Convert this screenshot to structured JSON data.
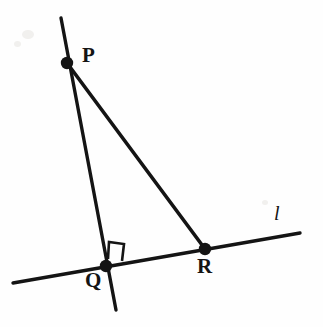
{
  "figure": {
    "kind": "geometry-diagram",
    "background_color": "#fefefe",
    "stroke_color": "#141414",
    "width": 323,
    "height": 327
  },
  "points": [
    {
      "id": "P",
      "label": "P",
      "x": 67,
      "y": 63,
      "marker": "filled-dot",
      "radius": 6.2
    },
    {
      "id": "Q",
      "label": "Q",
      "x": 106,
      "y": 266,
      "marker": "filled-dot",
      "radius": 6.2
    },
    {
      "id": "R",
      "label": "R",
      "x": 205,
      "y": 249,
      "marker": "filled-dot",
      "radius": 6.2
    }
  ],
  "lines": [
    {
      "id": "line-l",
      "label": "l",
      "label_style": "italic",
      "x1": 13,
      "y1": 283,
      "x2": 300,
      "y2": 233,
      "stroke_width": 3.4,
      "through": [
        "Q",
        "R"
      ]
    },
    {
      "id": "line-pq-extended",
      "label": "",
      "x1": 61,
      "y1": 18,
      "x2": 116,
      "y2": 310,
      "stroke_width": 3.4,
      "through": [
        "P",
        "Q"
      ]
    }
  ],
  "segments": [
    {
      "id": "segment-PR",
      "from": "P",
      "to": "R",
      "x1": 67,
      "y1": 63,
      "x2": 205,
      "y2": 249,
      "stroke_width": 3.6
    }
  ],
  "angle_markers": [
    {
      "id": "right-angle-Q",
      "at": "Q",
      "type": "right-angle-square",
      "measure": "90",
      "points": "108,259 109,242 124,244 122,261",
      "stroke_width": 2.6
    }
  ],
  "labels": {
    "P": "P",
    "Q": "Q",
    "R": "R",
    "l": "l"
  }
}
